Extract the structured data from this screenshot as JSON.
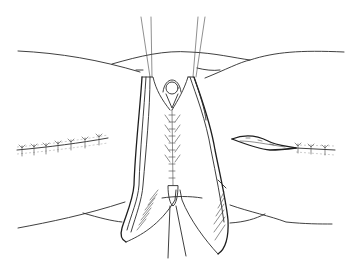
{
  "figure": {
    "colors": {
      "line": "#2a2a2a",
      "background": "#ffffff"
    }
  }
}
